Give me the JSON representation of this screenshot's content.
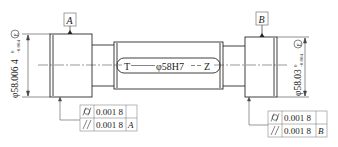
{
  "drawing": {
    "type": "shaft-gauge-engineering-drawing",
    "datums": {
      "left": "A",
      "right": "B"
    },
    "left_diameter": {
      "main": "φ58.006 4",
      "upper_dev": "0",
      "lower_dev": "-0.004",
      "envelope": "E"
    },
    "right_diameter": {
      "main": "φ58.03",
      "upper_dev": "0",
      "lower_dev": "-0.004",
      "envelope": "E"
    },
    "center_label": {
      "left": "T",
      "middle": "φ58H7",
      "right": "Z"
    },
    "fcf_left": {
      "rows": [
        {
          "symbol": "cylindricity",
          "glyph": "/○/",
          "tolerance": "0.001 8",
          "datum": ""
        },
        {
          "symbol": "parallelism",
          "glyph": "//",
          "tolerance": "0.001 8",
          "datum": "A"
        }
      ]
    },
    "fcf_right": {
      "rows": [
        {
          "symbol": "cylindricity",
          "glyph": "/○/",
          "tolerance": "0.001 8",
          "datum": ""
        },
        {
          "symbol": "parallelism",
          "glyph": "//",
          "tolerance": "0.001 8",
          "datum": "B"
        }
      ]
    },
    "colors": {
      "line": "#2a2a2a",
      "box": "#8a8a8a",
      "background": "#ffffff"
    }
  }
}
